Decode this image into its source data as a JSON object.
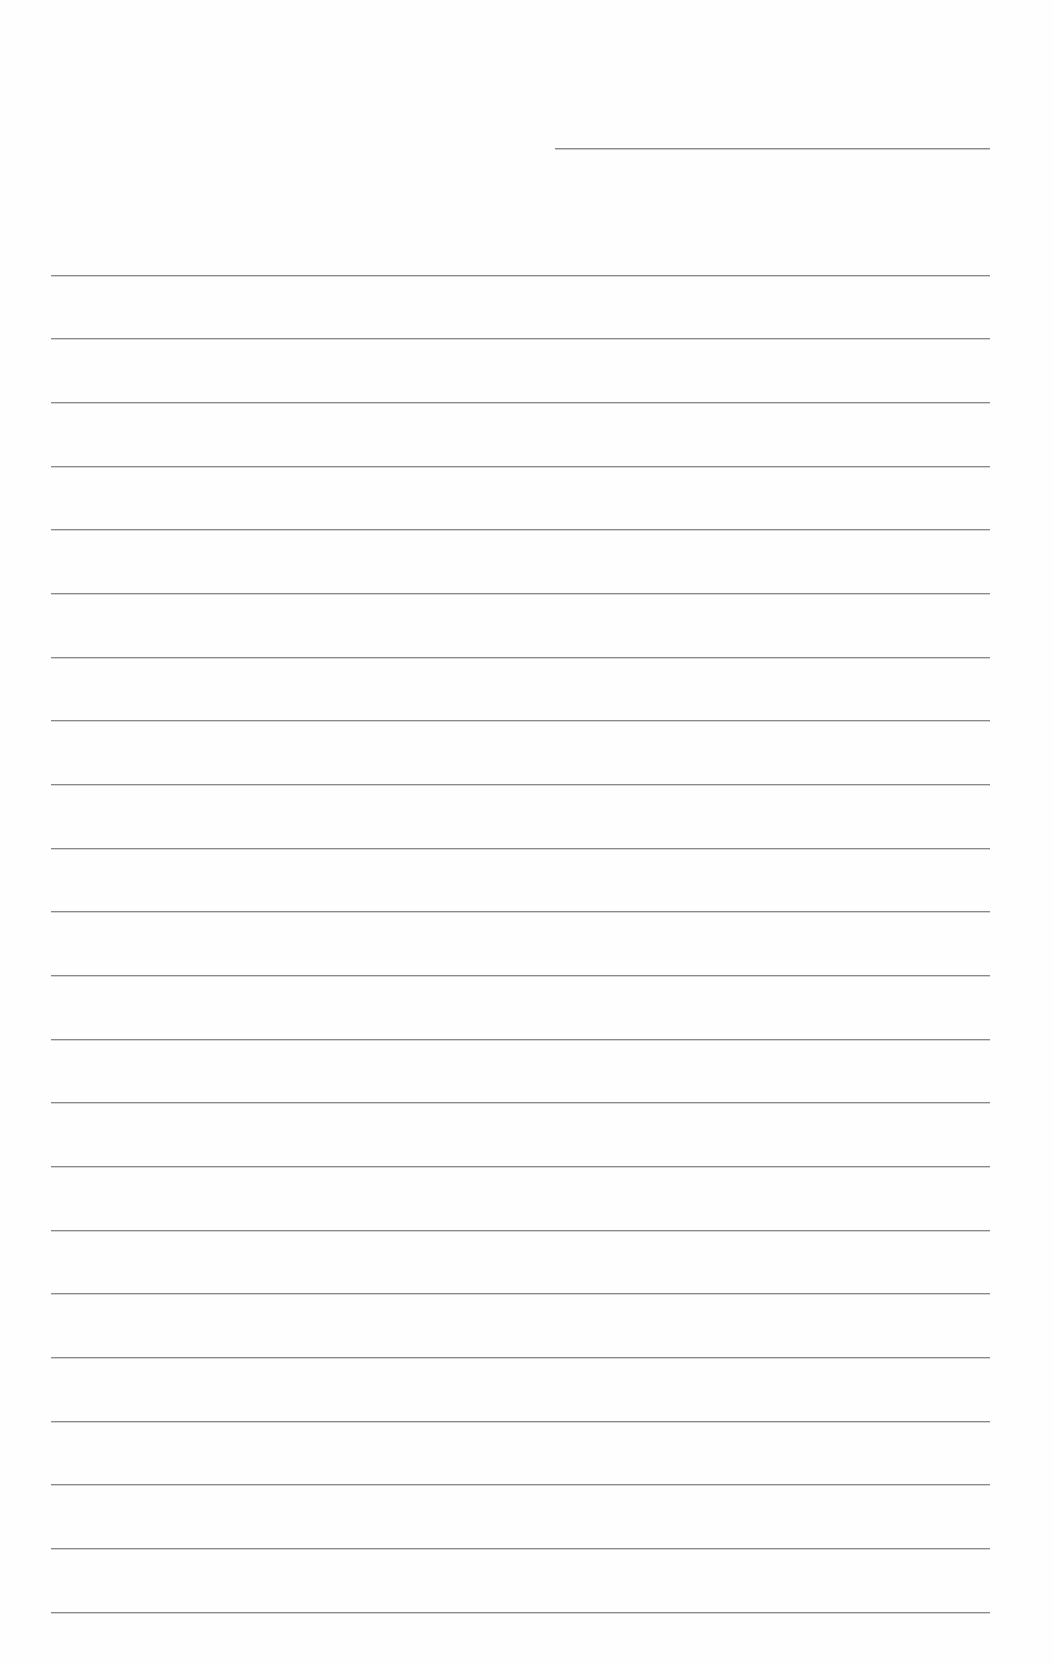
{
  "page": {
    "type": "ruled-notebook-paper",
    "background_color": "#fefefe",
    "line_color": "#8a8a8a"
  },
  "header": {
    "field_line": {
      "x": 555,
      "y": 148,
      "width": 435
    },
    "label": ""
  },
  "ruled_lines": {
    "count": 22,
    "left": 51,
    "right": 990,
    "y_positions": [
      275,
      338,
      402,
      466,
      529,
      593,
      657,
      720,
      784,
      848,
      911,
      975,
      1039,
      1102,
      1166,
      1230,
      1293,
      1357,
      1421,
      1484,
      1548,
      1612
    ],
    "entries": [
      "",
      "",
      "",
      "",
      "",
      "",
      "",
      "",
      "",
      "",
      "",
      "",
      "",
      "",
      "",
      "",
      "",
      "",
      "",
      "",
      "",
      ""
    ]
  }
}
